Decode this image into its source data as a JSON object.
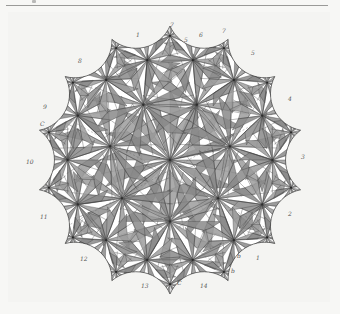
{
  "figure": {
    "title": "",
    "center": [
      170,
      160
    ],
    "radius": 128,
    "cusps": 14,
    "colors": {
      "shade": "#9c9c9c",
      "shade_dark": "#8a8a8a",
      "line": "#3a3a3a",
      "paper": "#f4f4f2",
      "light": "#ffffff"
    }
  },
  "labels": [
    {
      "text": "1",
      "x": 136,
      "y": 32
    },
    {
      "text": "7",
      "x": 170,
      "y": 22
    },
    {
      "text": "6",
      "x": 199,
      "y": 32
    },
    {
      "text": "7",
      "x": 222,
      "y": 28
    },
    {
      "text": "5",
      "x": 184,
      "y": 37
    },
    {
      "text": "5",
      "x": 251,
      "y": 50
    },
    {
      "text": "8",
      "x": 78,
      "y": 58
    },
    {
      "text": "4",
      "x": 288,
      "y": 96
    },
    {
      "text": "9",
      "x": 43,
      "y": 104
    },
    {
      "text": "C",
      "x": 40,
      "y": 121
    },
    {
      "text": "3",
      "x": 301,
      "y": 154
    },
    {
      "text": "10",
      "x": 26,
      "y": 159
    },
    {
      "text": "2",
      "x": 288,
      "y": 211
    },
    {
      "text": "11",
      "x": 40,
      "y": 214
    },
    {
      "text": "12",
      "x": 80,
      "y": 256
    },
    {
      "text": "1",
      "x": 256,
      "y": 255
    },
    {
      "text": "b",
      "x": 237,
      "y": 253
    },
    {
      "text": "b",
      "x": 231,
      "y": 268
    },
    {
      "text": "C",
      "x": 177,
      "y": 280
    },
    {
      "text": "13",
      "x": 141,
      "y": 283
    },
    {
      "text": "14",
      "x": 200,
      "y": 283
    }
  ]
}
